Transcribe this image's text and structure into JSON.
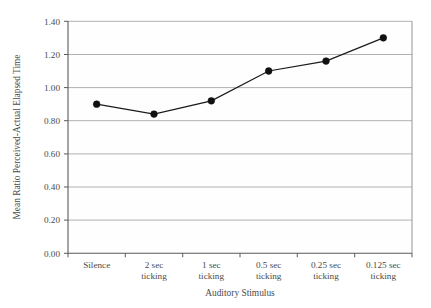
{
  "chart_data": {
    "type": "line",
    "title": "",
    "subtitle": "",
    "xlabel": "Auditory Stimulus",
    "ylabel": "Mean Ratio Perceived-Actual Elapsed Time",
    "categories": [
      "Silence",
      "2 sec ticking",
      "1 sec ticking",
      "0.5 sec ticking",
      "0.25 sec ticking",
      "0.125 sec ticking"
    ],
    "category_lines": [
      [
        "Silence",
        ""
      ],
      [
        "2 sec",
        "ticking"
      ],
      [
        "1 sec",
        "ticking"
      ],
      [
        "0.5 sec",
        "ticking"
      ],
      [
        "0.25 sec",
        "ticking"
      ],
      [
        "0.125 sec",
        "ticking"
      ]
    ],
    "values": [
      0.9,
      0.84,
      0.92,
      1.1,
      1.16,
      1.3
    ],
    "series": [
      {
        "name": "Mean Ratio Perceived-Actual Elapsed Time",
        "values": [
          0.9,
          0.84,
          0.92,
          1.1,
          1.16,
          1.3
        ]
      }
    ],
    "ylim": [
      0.0,
      1.4
    ],
    "ytick_values": [
      0.0,
      0.2,
      0.4,
      0.6,
      0.8,
      1.0,
      1.2,
      1.4
    ],
    "ytick_labels": [
      "0.00",
      "0.20",
      "0.40",
      "0.60",
      "0.80",
      "1.00",
      "1.20",
      "1.40"
    ],
    "grid": "horizontal",
    "legend": "none",
    "marker": "filled-circle",
    "line_color": "#1a1a1a",
    "marker_color": "#111111",
    "grid_color": "#a8a8a8",
    "axis_color": "#5a5a5a",
    "background_color": "#ffffff"
  }
}
